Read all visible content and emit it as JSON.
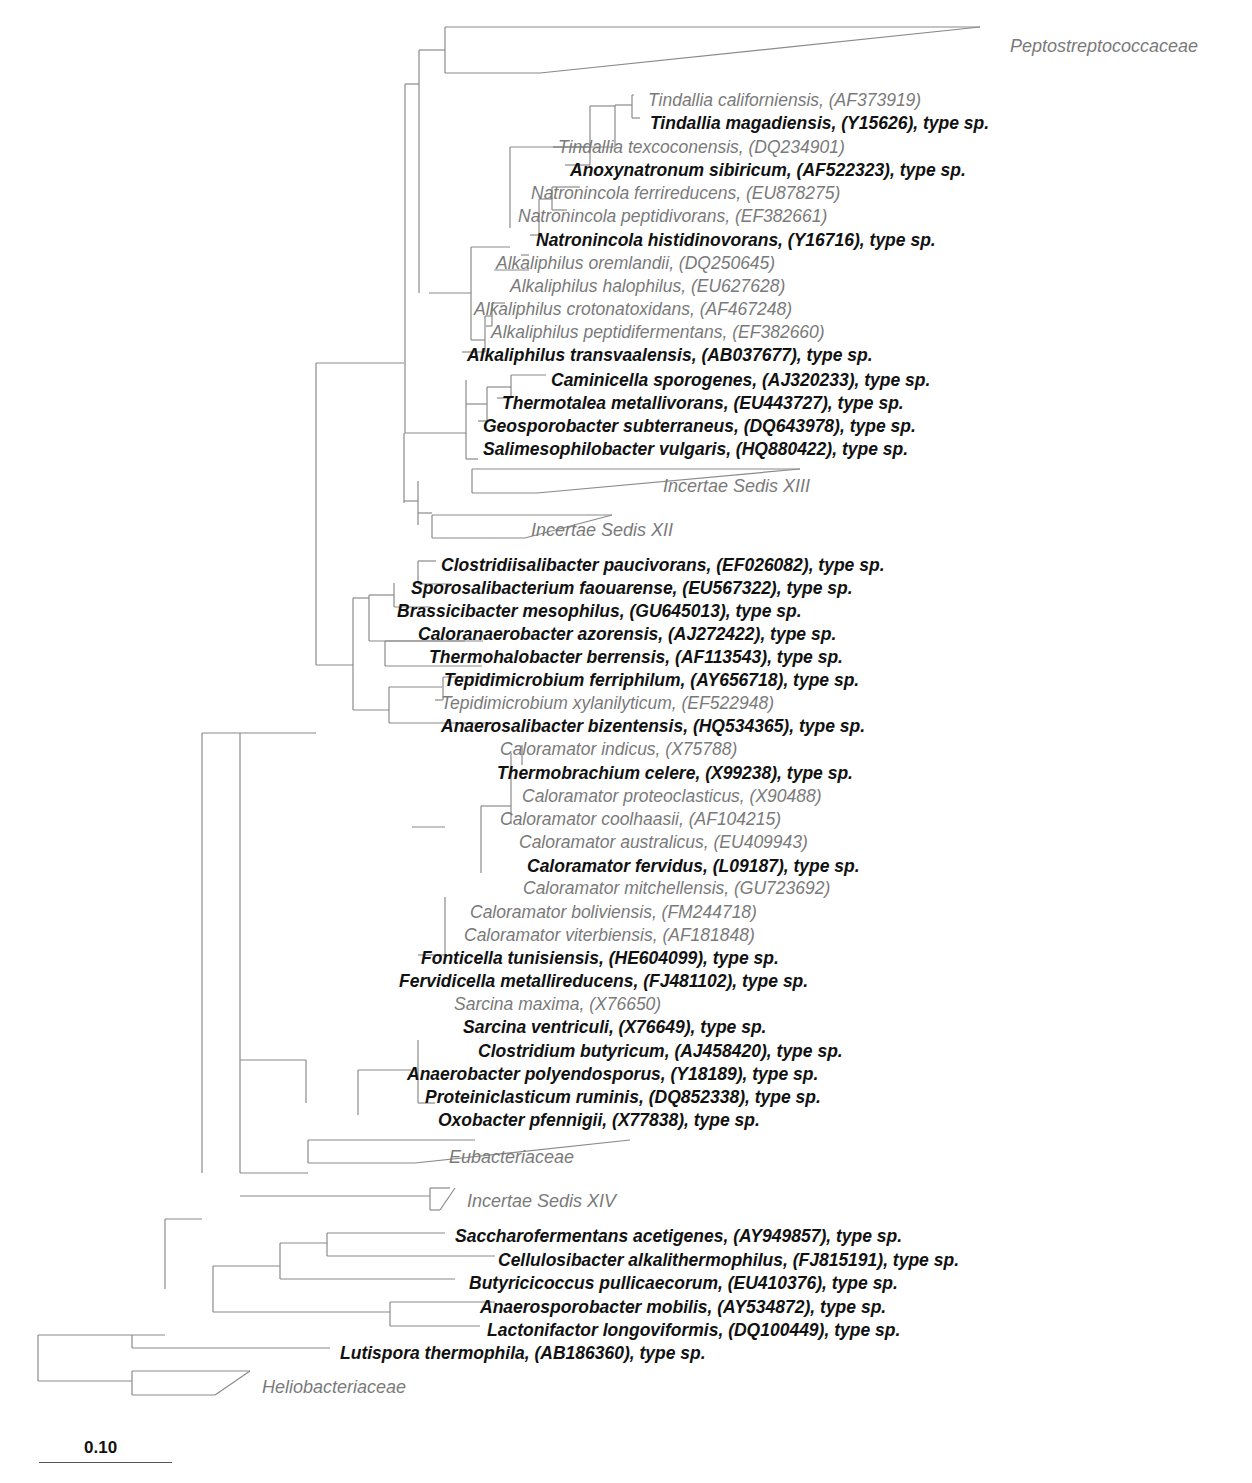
{
  "figure": {
    "type": "phylogenetic-tree",
    "line_color": "#8a8a8a",
    "type_species_color": "#111111",
    "other_species_color": "#7a7a7a",
    "scale_bar": {
      "label": "0.10"
    }
  },
  "leaves": [
    {
      "id": "c_pepto",
      "text": "Peptostreptococcaceae",
      "kind": "clade",
      "x": 1010,
      "y": 46
    },
    {
      "id": "l1",
      "text": "Tindallia californiensis, (AF373919)",
      "kind": "other",
      "x": 648,
      "y": 100
    },
    {
      "id": "l2",
      "text": "Tindallia magadiensis, (Y15626), type sp.",
      "kind": "type",
      "x": 650,
      "y": 123
    },
    {
      "id": "l3",
      "text": "Tindallia texcoconensis, (DQ234901)",
      "kind": "other",
      "x": 558,
      "y": 147
    },
    {
      "id": "l4",
      "text": "Anoxynatronum sibiricum, (AF522323), type sp.",
      "kind": "type",
      "x": 570,
      "y": 170
    },
    {
      "id": "l5",
      "text": "Natronincola ferrireducens, (EU878275)",
      "kind": "other",
      "x": 531,
      "y": 193
    },
    {
      "id": "l6",
      "text": "Natronincola peptidivorans, (EF382661)",
      "kind": "other",
      "x": 518,
      "y": 216
    },
    {
      "id": "l7",
      "text": "Natronincola histidinovorans, (Y16716), type sp.",
      "kind": "type",
      "x": 536,
      "y": 240
    },
    {
      "id": "l8",
      "text": "Alkaliphilus oremlandii, (DQ250645)",
      "kind": "other",
      "x": 496,
      "y": 263
    },
    {
      "id": "l9",
      "text": "Alkaliphilus halophilus, (EU627628)",
      "kind": "other",
      "x": 510,
      "y": 286
    },
    {
      "id": "l10",
      "text": "Alkaliphilus crotonatoxidans, (AF467248)",
      "kind": "other",
      "x": 474,
      "y": 309
    },
    {
      "id": "l11",
      "text": "Alkaliphilus peptidifermentans, (EF382660)",
      "kind": "other",
      "x": 491,
      "y": 332
    },
    {
      "id": "l12",
      "text": "Alkaliphilus transvaalensis, (AB037677), type sp.",
      "kind": "type",
      "x": 467,
      "y": 355
    },
    {
      "id": "l13",
      "text": "Caminicella sporogenes, (AJ320233), type sp.",
      "kind": "type",
      "x": 551,
      "y": 380
    },
    {
      "id": "l14",
      "text": "Thermotalea metallivorans, (EU443727), type sp.",
      "kind": "type",
      "x": 502,
      "y": 403
    },
    {
      "id": "l15",
      "text": "Geosporobacter subterraneus, (DQ643978), type sp.",
      "kind": "type",
      "x": 483,
      "y": 426
    },
    {
      "id": "l16",
      "text": "Salimesophilobacter vulgaris, (HQ880422), type sp.",
      "kind": "type",
      "x": 483,
      "y": 449
    },
    {
      "id": "c_is13",
      "text": "Incertae Sedis XIII",
      "kind": "clade",
      "x": 663,
      "y": 486
    },
    {
      "id": "c_is12",
      "text": "Incertae Sedis XII",
      "kind": "clade",
      "x": 531,
      "y": 530
    },
    {
      "id": "l17",
      "text": "Clostridiisalibacter paucivorans, (EF026082), type sp.",
      "kind": "type",
      "x": 441,
      "y": 565
    },
    {
      "id": "l18",
      "text": "Sporosalibacterium faouarense, (EU567322), type sp.",
      "kind": "type",
      "x": 411,
      "y": 588
    },
    {
      "id": "l19",
      "text": "Brassicibacter mesophilus, (GU645013), type sp.",
      "kind": "type",
      "x": 397,
      "y": 611
    },
    {
      "id": "l20",
      "text": "Caloranaerobacter azorensis, (AJ272422), type sp.",
      "kind": "type",
      "x": 418,
      "y": 634
    },
    {
      "id": "l21",
      "text": "Thermohalobacter berrensis, (AF113543), type sp.",
      "kind": "type",
      "x": 429,
      "y": 657
    },
    {
      "id": "l22",
      "text": "Tepidimicrobium ferriphilum, (AY656718), type sp.",
      "kind": "type",
      "x": 444,
      "y": 680
    },
    {
      "id": "l23",
      "text": "Tepidimicrobium xylanilyticum, (EF522948)",
      "kind": "other",
      "x": 441,
      "y": 703
    },
    {
      "id": "l24",
      "text": "Anaerosalibacter bizentensis, (HQ534365), type sp.",
      "kind": "type",
      "x": 441,
      "y": 726
    },
    {
      "id": "l25",
      "text": "Caloramator indicus, (X75788)",
      "kind": "other",
      "x": 500,
      "y": 749
    },
    {
      "id": "l26",
      "text": "Thermobrachium celere, (X99238), type sp.",
      "kind": "type",
      "x": 497,
      "y": 773
    },
    {
      "id": "l27",
      "text": "Caloramator proteoclasticus, (X90488)",
      "kind": "other",
      "x": 522,
      "y": 796
    },
    {
      "id": "l28",
      "text": "Caloramator coolhaasii, (AF104215)",
      "kind": "other",
      "x": 500,
      "y": 819
    },
    {
      "id": "l29",
      "text": "Caloramator australicus, (EU409943)",
      "kind": "other",
      "x": 519,
      "y": 842
    },
    {
      "id": "l30",
      "text": "Caloramator fervidus, (L09187), type sp.",
      "kind": "type",
      "x": 527,
      "y": 866
    },
    {
      "id": "l31",
      "text": "Caloramator mitchellensis, (GU723692)",
      "kind": "other",
      "x": 523,
      "y": 888
    },
    {
      "id": "l32",
      "text": "Caloramator boliviensis, (FM244718)",
      "kind": "other",
      "x": 470,
      "y": 912
    },
    {
      "id": "l33",
      "text": "Caloramator viterbiensis, (AF181848)",
      "kind": "other",
      "x": 464,
      "y": 935
    },
    {
      "id": "l34",
      "text": "Fonticella tunisiensis, (HE604099), type sp.",
      "kind": "type",
      "x": 421,
      "y": 958
    },
    {
      "id": "l35",
      "text": "Fervidicella metallireducens, (FJ481102), type sp.",
      "kind": "type",
      "x": 399,
      "y": 981
    },
    {
      "id": "l36",
      "text": "Sarcina maxima, (X76650)",
      "kind": "other",
      "x": 454,
      "y": 1004
    },
    {
      "id": "l37",
      "text": "Sarcina ventriculi, (X76649), type sp.",
      "kind": "type",
      "x": 463,
      "y": 1027
    },
    {
      "id": "l38",
      "text": "Clostridium butyricum, (AJ458420), type sp.",
      "kind": "type",
      "x": 478,
      "y": 1051
    },
    {
      "id": "l39",
      "text": "Anaerobacter polyendosporus, (Y18189), type sp.",
      "kind": "type",
      "x": 407,
      "y": 1074
    },
    {
      "id": "l40",
      "text": "Proteiniclasticum ruminis, (DQ852338), type sp.",
      "kind": "type",
      "x": 425,
      "y": 1097
    },
    {
      "id": "l41",
      "text": "Oxobacter pfennigii, (X77838), type sp.",
      "kind": "type",
      "x": 438,
      "y": 1120
    },
    {
      "id": "c_eub",
      "text": "Eubacteriaceae",
      "kind": "clade",
      "x": 449,
      "y": 1157
    },
    {
      "id": "c_is14",
      "text": "Incertae Sedis XIV",
      "kind": "clade",
      "x": 467,
      "y": 1201
    },
    {
      "id": "l42",
      "text": "Saccharofermentans acetigenes, (AY949857), type sp.",
      "kind": "type",
      "x": 455,
      "y": 1236
    },
    {
      "id": "l43",
      "text": "Cellulosibacter alkalithermophilus, (FJ815191), type sp.",
      "kind": "type",
      "x": 498,
      "y": 1260
    },
    {
      "id": "l44",
      "text": "Butyricicoccus pullicaecorum, (EU410376), type sp.",
      "kind": "type",
      "x": 469,
      "y": 1283
    },
    {
      "id": "l45",
      "text": "Anaerosporobacter mobilis, (AY534872), type sp.",
      "kind": "type",
      "x": 480,
      "y": 1307
    },
    {
      "id": "l46",
      "text": "Lactonifactor longoviformis, (DQ100449), type sp.",
      "kind": "type",
      "x": 487,
      "y": 1330
    },
    {
      "id": "l47",
      "text": "Lutispora thermophila, (AB186360), type sp.",
      "kind": "type",
      "x": 340,
      "y": 1353
    },
    {
      "id": "c_helio",
      "text": "Heliobacteriaceae",
      "kind": "clade",
      "x": 262,
      "y": 1387
    }
  ],
  "branches": [
    [
      445,
      27,
      445,
      73
    ],
    [
      419,
      50,
      445,
      50
    ],
    [
      445,
      27,
      980,
      27
    ],
    [
      445,
      73,
      540,
      73
    ],
    [
      540,
      73,
      980,
      27
    ],
    [
      419,
      50,
      419,
      293
    ],
    [
      405,
      84,
      419,
      84
    ],
    [
      632,
      95,
      632,
      118
    ],
    [
      632,
      95,
      634,
      95
    ],
    [
      632,
      118,
      640,
      118
    ],
    [
      615,
      105,
      632,
      105
    ],
    [
      615,
      105,
      615,
      147
    ],
    [
      615,
      147,
      553,
      147
    ],
    [
      553,
      147,
      553,
      147
    ],
    [
      591,
      147,
      553,
      147
    ],
    [
      590,
      106,
      615,
      106
    ],
    [
      590,
      106,
      590,
      165
    ],
    [
      590,
      165,
      565,
      165
    ],
    [
      510,
      147,
      590,
      147
    ],
    [
      510,
      147,
      510,
      228
    ],
    [
      552,
      187,
      580,
      187
    ],
    [
      552,
      187,
      552,
      210
    ],
    [
      552,
      210,
      567,
      210
    ],
    [
      539,
      199,
      552,
      199
    ],
    [
      539,
      199,
      539,
      235
    ],
    [
      539,
      235,
      530,
      235
    ],
    [
      471,
      247,
      510,
      247
    ],
    [
      471,
      247,
      471,
      340
    ],
    [
      529,
      255,
      521,
      255
    ],
    [
      494,
      270,
      529,
      270
    ],
    [
      492,
      303,
      505,
      303
    ],
    [
      492,
      303,
      492,
      326
    ],
    [
      492,
      326,
      486,
      326
    ],
    [
      485,
      316,
      492,
      316
    ],
    [
      485,
      316,
      485,
      352
    ],
    [
      485,
      352,
      462,
      352
    ],
    [
      471,
      340,
      485,
      340
    ],
    [
      429,
      293,
      471,
      293
    ],
    [
      405,
      84,
      405,
      433
    ],
    [
      405,
      433,
      466,
      433
    ],
    [
      466,
      380,
      466,
      459
    ],
    [
      511,
      375,
      546,
      375
    ],
    [
      511,
      375,
      511,
      398
    ],
    [
      511,
      398,
      497,
      398
    ],
    [
      487,
      387,
      511,
      387
    ],
    [
      487,
      387,
      487,
      421
    ],
    [
      487,
      421,
      478,
      421
    ],
    [
      466,
      404,
      487,
      404
    ],
    [
      466,
      459,
      478,
      459
    ],
    [
      404,
      433,
      404,
      503
    ],
    [
      404,
      501,
      418,
      501
    ],
    [
      418,
      481,
      418,
      525
    ],
    [
      472,
      469,
      800,
      469
    ],
    [
      472,
      469,
      472,
      493
    ],
    [
      472,
      493,
      537,
      493
    ],
    [
      537,
      493,
      800,
      469
    ],
    [
      418,
      513,
      432,
      513
    ],
    [
      432,
      515,
      612,
      515
    ],
    [
      432,
      515,
      432,
      538
    ],
    [
      432,
      538,
      525,
      538
    ],
    [
      525,
      538,
      612,
      515
    ],
    [
      316,
      363,
      404,
      363
    ],
    [
      316,
      363,
      316,
      665
    ],
    [
      316,
      665,
      353,
      665
    ],
    [
      353,
      598,
      353,
      710
    ],
    [
      369,
      595,
      369,
      641
    ],
    [
      369,
      641,
      483,
      641
    ],
    [
      394,
      583,
      394,
      607
    ],
    [
      394,
      607,
      431,
      607
    ],
    [
      418,
      561,
      436,
      561
    ],
    [
      418,
      561,
      418,
      584
    ],
    [
      418,
      584,
      452,
      584
    ],
    [
      369,
      595,
      394,
      595
    ],
    [
      385,
      641,
      385,
      666
    ],
    [
      385,
      641,
      465,
      641
    ],
    [
      385,
      666,
      482,
      666
    ],
    [
      353,
      598,
      369,
      598
    ],
    [
      389,
      687,
      442,
      687
    ],
    [
      389,
      687,
      389,
      723
    ],
    [
      389,
      723,
      500,
      723
    ],
    [
      443,
      677,
      500,
      677
    ],
    [
      443,
      677,
      443,
      700
    ],
    [
      443,
      700,
      435,
      700
    ],
    [
      353,
      710,
      389,
      710
    ],
    [
      240,
      733,
      316,
      733
    ],
    [
      240,
      733,
      240,
      1173
    ],
    [
      202,
      733,
      240,
      733
    ],
    [
      202,
      733,
      202,
      1173
    ],
    [
      306,
      1060,
      240,
      1060
    ],
    [
      306,
      1060,
      306,
      1103
    ],
    [
      445,
      897,
      445,
      955
    ],
    [
      445,
      955,
      418,
      955
    ],
    [
      412,
      827,
      445,
      827
    ],
    [
      481,
      806,
      511,
      806
    ],
    [
      481,
      806,
      481,
      873
    ],
    [
      511,
      753,
      511,
      824
    ],
    [
      522,
      745,
      522,
      765
    ],
    [
      530,
      888,
      530,
      888
    ],
    [
      358,
      1070,
      411,
      1070
    ],
    [
      358,
      1070,
      358,
      1115
    ],
    [
      418,
      1103,
      435,
      1103
    ],
    [
      418,
      1103,
      418,
      1040
    ],
    [
      308,
      1140,
      475,
      1140
    ],
    [
      308,
      1140,
      308,
      1163
    ],
    [
      308,
      1163,
      415,
      1163
    ],
    [
      415,
      1163,
      630,
      1140
    ],
    [
      240,
      1173,
      308,
      1173
    ],
    [
      240,
      1196,
      430,
      1196
    ],
    [
      430,
      1188,
      450,
      1188
    ],
    [
      430,
      1188,
      430,
      1210
    ],
    [
      430,
      1210,
      440,
      1210
    ],
    [
      440,
      1210,
      455,
      1188
    ],
    [
      165,
      1219,
      202,
      1219
    ],
    [
      165,
      1219,
      165,
      1289
    ],
    [
      213,
      1266,
      280,
      1266
    ],
    [
      213,
      1266,
      213,
      1312
    ],
    [
      213,
      1312,
      390,
      1312
    ],
    [
      280,
      1243,
      327,
      1243
    ],
    [
      280,
      1243,
      280,
      1279
    ],
    [
      280,
      1279,
      455,
      1279
    ],
    [
      327,
      1233,
      445,
      1233
    ],
    [
      327,
      1233,
      327,
      1256
    ],
    [
      327,
      1256,
      495,
      1256
    ],
    [
      390,
      1302,
      495,
      1302
    ],
    [
      390,
      1302,
      390,
      1326
    ],
    [
      390,
      1326,
      480,
      1326
    ],
    [
      132,
      1335,
      165,
      1335
    ],
    [
      132,
      1335,
      132,
      1348
    ],
    [
      132,
      1348,
      330,
      1348
    ],
    [
      38,
      1335,
      132,
      1335
    ],
    [
      38,
      1335,
      38,
      1381
    ],
    [
      38,
      1381,
      132,
      1381
    ],
    [
      132,
      1371,
      132,
      1395
    ],
    [
      132,
      1371,
      250,
      1371
    ],
    [
      132,
      1395,
      215,
      1395
    ],
    [
      215,
      1395,
      250,
      1371
    ]
  ]
}
